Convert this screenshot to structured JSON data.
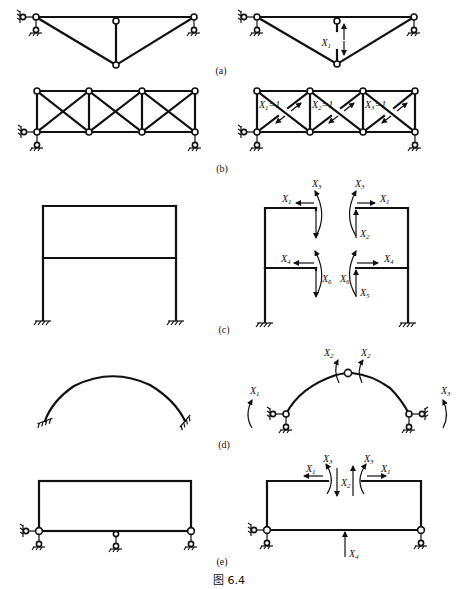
{
  "figure": {
    "caption": "图 6.4",
    "panels": [
      {
        "id": "a",
        "label": "(a)",
        "left": "Truss with pinned supports (original)",
        "right": "Primary system with redundant member force",
        "redundants": [
          "X1"
        ]
      },
      {
        "id": "b",
        "label": "(b)",
        "left": "Three-panel cross-braced truss (original)",
        "right": "Primary system with cut diagonals",
        "redundants": [
          "X1=1",
          "X2=1",
          "X3=1"
        ]
      },
      {
        "id": "c",
        "label": "(c)",
        "left": "Two-storey fixed-base frame (original)",
        "right": "Primary system cut at beams",
        "redundants": [
          "X1",
          "X2",
          "X3",
          "X4",
          "X5",
          "X6"
        ]
      },
      {
        "id": "d",
        "label": "(d)",
        "left": "Fixed-end arch (original)",
        "right": "Three-hinged arch primary system",
        "redundants": [
          "X1",
          "X2",
          "X3"
        ]
      },
      {
        "id": "e",
        "label": "(e)",
        "left": "Closed frame on three supports (original)",
        "right": "Primary system with cut top beam and removed middle support",
        "redundants": [
          "X1",
          "X2",
          "X3",
          "X4"
        ]
      }
    ]
  },
  "labels": {
    "a": "(a)",
    "b": "(b)",
    "c": "(c)",
    "d": "(d)",
    "e": "(e)",
    "X": "X",
    "s1": "1",
    "s2": "2",
    "s3": "3",
    "s4": "4",
    "s5": "5",
    "s6": "6",
    "eq1": "=1"
  }
}
